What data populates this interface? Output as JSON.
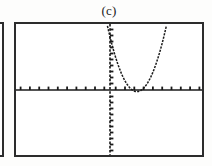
{
  "figure": {
    "label": "(c)",
    "caption_position": "top-center"
  },
  "neighbor_figure": {
    "name": "adjacent-figure-partial-frame",
    "visible_fraction": "right edge only"
  },
  "calculator_screen": {
    "name": "graphing-calculator-viewport",
    "border_color": "#2c2c2c",
    "background_color": "#ffffff",
    "curve_color": "#1a1a1a",
    "axis_color": "#1a1a1a"
  },
  "chart_data": {
    "type": "line",
    "title": "(c)",
    "xlabel": "",
    "ylabel": "",
    "grid": false,
    "legend": null,
    "axes": {
      "x_axis_visible": true,
      "y_axis_visible": true,
      "x_axis_y_value": 0,
      "y_axis_x_value": 0,
      "xlim": [
        -10,
        10
      ],
      "ylim": [
        -6.2,
        6.2
      ],
      "x_tick_step": 1,
      "y_tick_step": 1,
      "x_tick_count": 20,
      "y_tick_count": 24,
      "tick_style": "dashed tick marks on axes"
    },
    "series": [
      {
        "name": "parabola",
        "style": "dotted-pixelated curve",
        "equation": "y = a(x - h)^2 + k",
        "vertex": [
          3.0,
          -0.2
        ],
        "opens": "up",
        "a": 0.62,
        "h": 3.0,
        "k": -0.2,
        "x": [
          0.3,
          0.6,
          0.9,
          1.2,
          1.5,
          1.8,
          2.1,
          2.4,
          2.7,
          3.0,
          3.3,
          3.6,
          3.9,
          4.2,
          4.5,
          4.8,
          5.1,
          5.4,
          5.7,
          6.0,
          6.3,
          6.6,
          6.9,
          7.2
        ],
        "y": [
          4.82,
          3.78,
          2.81,
          1.91,
          1.2,
          0.69,
          0.3,
          0.02,
          -0.14,
          -0.2,
          -0.14,
          -0.02,
          0.3,
          0.69,
          1.2,
          1.91,
          2.81,
          3.78,
          4.82,
          5.4,
          5.9,
          6.1,
          6.2,
          6.2
        ],
        "x_roots": [
          2.43,
          3.57
        ],
        "left_branch_top_x": 0.25,
        "right_branch_top_x": 6.1
      }
    ]
  }
}
